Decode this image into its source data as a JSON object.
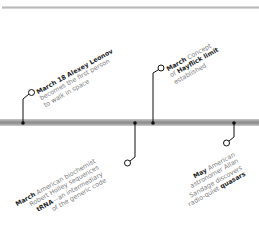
{
  "colors": {
    "rule": "#bdbdbd",
    "timeline": "#8f8f8f",
    "connector": "#111111",
    "text": "#7a7a7a",
    "emphasis": "#1e1e1e"
  },
  "events": [
    {
      "position": "above",
      "date": "March 18",
      "lines": [
        "Alexey Leonov",
        "becomes the first person",
        "to walk in space"
      ],
      "bold_terms": [
        "Alexey Leonov"
      ]
    },
    {
      "position": "below",
      "date": "March",
      "lines": [
        "American biochemist",
        "Robert Holley sequences",
        "tRNA",
        "—an intermediary",
        "of the generic code"
      ],
      "bold_terms": [
        "tRNA"
      ]
    },
    {
      "position": "above",
      "date": "March",
      "lines": [
        "Concept",
        "of",
        "Hayflick limit",
        "established"
      ],
      "bold_terms": [
        "Hayflick limit"
      ]
    },
    {
      "position": "below",
      "date": "May",
      "lines": [
        "American",
        "astronomer Allan",
        "Sandage discovers",
        "radio-quiet",
        "quasars"
      ],
      "bold_terms": [
        "quasars"
      ]
    }
  ]
}
